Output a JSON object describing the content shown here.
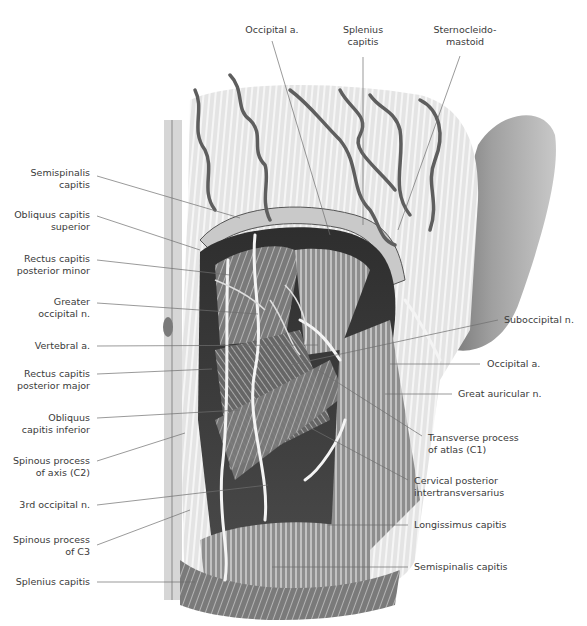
{
  "figure": {
    "type": "anatomical-illustration",
    "colors": {
      "background": "#ffffff",
      "label_text": "#3a3a3a",
      "leader_line": "#6e6e6e",
      "muscle_light": "#e6e6e6",
      "muscle_mid": "#a8a8a8",
      "muscle_dark": "#3a3a3a",
      "vessel": "#5a5a5a",
      "nerve": "#f2f2f2",
      "ear": "#8c8c8c"
    }
  },
  "labels_top": [
    {
      "id": "occipital-a-top",
      "lines": [
        "Occipital a."
      ]
    },
    {
      "id": "splenius-capitis-top",
      "lines": [
        "Splenius",
        "capitis"
      ]
    },
    {
      "id": "sternocleidomastoid",
      "lines": [
        "Sternocleido-",
        "mastoid"
      ]
    }
  ],
  "labels_left": [
    {
      "id": "semispinalis-capitis-left",
      "lines": [
        "Semispinalis",
        "capitis"
      ]
    },
    {
      "id": "obliquus-capitis-superior",
      "lines": [
        "Obliquus capitis",
        "superior"
      ]
    },
    {
      "id": "rectus-capitis-posterior-minor",
      "lines": [
        "Rectus capitis",
        "posterior minor"
      ]
    },
    {
      "id": "greater-occipital-n",
      "lines": [
        "Greater",
        "occipital n."
      ]
    },
    {
      "id": "vertebral-a",
      "lines": [
        "Vertebral a."
      ]
    },
    {
      "id": "rectus-capitis-posterior-major",
      "lines": [
        "Rectus capitis",
        "posterior major"
      ]
    },
    {
      "id": "obliquus-capitis-inferior",
      "lines": [
        "Obliquus",
        "capitis inferior"
      ]
    },
    {
      "id": "spinous-process-axis",
      "lines": [
        "Spinous process",
        "of axis (C2)"
      ]
    },
    {
      "id": "third-occipital-n",
      "lines": [
        "3rd occipital n."
      ]
    },
    {
      "id": "spinous-process-c3",
      "lines": [
        "Spinous process",
        "of C3"
      ]
    },
    {
      "id": "splenius-capitis-left",
      "lines": [
        "Splenius capitis"
      ]
    }
  ],
  "labels_right": [
    {
      "id": "suboccipital-n",
      "lines": [
        "Suboccipital n."
      ]
    },
    {
      "id": "occipital-a-right",
      "lines": [
        "Occipital a."
      ]
    },
    {
      "id": "great-auricular-n",
      "lines": [
        "Great auricular n."
      ]
    },
    {
      "id": "transverse-process-atlas",
      "lines": [
        "Transverse process",
        "of atlas (C1)"
      ]
    },
    {
      "id": "cervical-posterior-intertransversarius",
      "lines": [
        "Cervical posterior",
        "intertransversarius"
      ]
    },
    {
      "id": "longissimus-capitis",
      "lines": [
        "Longissimus capitis"
      ]
    },
    {
      "id": "semispinalis-capitis-right",
      "lines": [
        "Semispinalis capitis"
      ]
    }
  ]
}
